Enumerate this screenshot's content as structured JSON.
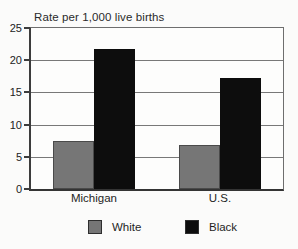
{
  "figure": {
    "background": "#fbfbfa"
  },
  "chart_data": {
    "type": "bar",
    "title": "Rate per 1,000 live births",
    "categories": [
      "Michigan",
      "U.S."
    ],
    "series": [
      {
        "name": "White",
        "color": "#767676",
        "values": [
          7.5,
          6.9
        ]
      },
      {
        "name": "Black",
        "color": "#0d0d0d",
        "values": [
          21.8,
          17.2
        ]
      }
    ],
    "xlabel": "",
    "ylabel": "Rate per 1,000 live births",
    "ylim": [
      0,
      25
    ],
    "yticks": [
      0,
      5,
      10,
      15,
      20,
      25
    ],
    "grid": "horizontal",
    "legend_position": "bottom",
    "axis_color": "#3c3c3c",
    "grid_color": "#787878",
    "text_color": "#1c1c1c"
  }
}
